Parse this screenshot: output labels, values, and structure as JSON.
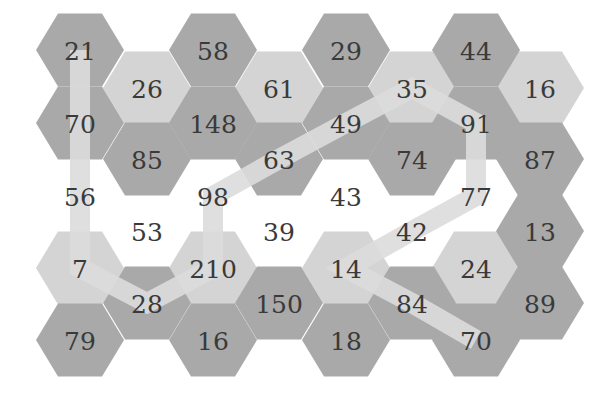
{
  "puzzle": {
    "type": "hexagonal number path puzzle",
    "colors": {
      "dark": "#a9a9a9",
      "light": "#d4d4d4",
      "white": "#ffffff",
      "path": "#dcdcdc",
      "text": "#3a3a3a"
    },
    "cells": [
      {
        "id": "c0r0",
        "col": 0,
        "row": 0,
        "value": "21",
        "shade": "dark"
      },
      {
        "id": "c0r1",
        "col": 0,
        "row": 1,
        "value": "70",
        "shade": "dark"
      },
      {
        "id": "c0r2",
        "col": 0,
        "row": 2,
        "value": "56",
        "shade": "white"
      },
      {
        "id": "c0r3",
        "col": 0,
        "row": 3,
        "value": "7",
        "shade": "light"
      },
      {
        "id": "c0r4",
        "col": 0,
        "row": 4,
        "value": "79",
        "shade": "dark"
      },
      {
        "id": "c1r0",
        "col": 1,
        "row": 0,
        "value": "26",
        "shade": "light"
      },
      {
        "id": "c1r1",
        "col": 1,
        "row": 1,
        "value": "85",
        "shade": "dark"
      },
      {
        "id": "c1r2",
        "col": 1,
        "row": 2,
        "value": "53",
        "shade": "white"
      },
      {
        "id": "c1r3",
        "col": 1,
        "row": 3,
        "value": "28",
        "shade": "dark"
      },
      {
        "id": "c2r0",
        "col": 2,
        "row": 0,
        "value": "58",
        "shade": "dark"
      },
      {
        "id": "c2r1",
        "col": 2,
        "row": 1,
        "value": "148",
        "shade": "dark"
      },
      {
        "id": "c2r2",
        "col": 2,
        "row": 2,
        "value": "98",
        "shade": "white"
      },
      {
        "id": "c2r3",
        "col": 2,
        "row": 3,
        "value": "210",
        "shade": "light"
      },
      {
        "id": "c2r4",
        "col": 2,
        "row": 4,
        "value": "16",
        "shade": "dark"
      },
      {
        "id": "c3r0",
        "col": 3,
        "row": 0,
        "value": "61",
        "shade": "light"
      },
      {
        "id": "c3r1",
        "col": 3,
        "row": 1,
        "value": "63",
        "shade": "dark"
      },
      {
        "id": "c3r2",
        "col": 3,
        "row": 2,
        "value": "39",
        "shade": "white"
      },
      {
        "id": "c3r3",
        "col": 3,
        "row": 3,
        "value": "150",
        "shade": "dark"
      },
      {
        "id": "c4r0",
        "col": 4,
        "row": 0,
        "value": "29",
        "shade": "dark"
      },
      {
        "id": "c4r1",
        "col": 4,
        "row": 1,
        "value": "49",
        "shade": "dark"
      },
      {
        "id": "c4r2",
        "col": 4,
        "row": 2,
        "value": "43",
        "shade": "white"
      },
      {
        "id": "c4r3",
        "col": 4,
        "row": 3,
        "value": "14",
        "shade": "light"
      },
      {
        "id": "c4r4",
        "col": 4,
        "row": 4,
        "value": "18",
        "shade": "dark"
      },
      {
        "id": "c5r0",
        "col": 5,
        "row": 0,
        "value": "35",
        "shade": "light"
      },
      {
        "id": "c5r1",
        "col": 5,
        "row": 1,
        "value": "74",
        "shade": "dark"
      },
      {
        "id": "c5r2",
        "col": 5,
        "row": 2,
        "value": "42",
        "shade": "white"
      },
      {
        "id": "c5r3",
        "col": 5,
        "row": 3,
        "value": "84",
        "shade": "dark"
      },
      {
        "id": "c6r0",
        "col": 6,
        "row": 0,
        "value": "44",
        "shade": "dark"
      },
      {
        "id": "c6r1",
        "col": 6,
        "row": 1,
        "value": "91",
        "shade": "dark"
      },
      {
        "id": "c6r2",
        "col": 6,
        "row": 2,
        "value": "77",
        "shade": "white"
      },
      {
        "id": "c6r3",
        "col": 6,
        "row": 3,
        "value": "24",
        "shade": "light"
      },
      {
        "id": "c6r4",
        "col": 6,
        "row": 4,
        "value": "70",
        "shade": "dark"
      },
      {
        "id": "c7r0",
        "col": 7,
        "row": 0,
        "value": "16",
        "shade": "light"
      },
      {
        "id": "c7r1",
        "col": 7,
        "row": 1,
        "value": "87",
        "shade": "dark"
      },
      {
        "id": "c7r2",
        "col": 7,
        "row": 2,
        "value": "13",
        "shade": "dark"
      },
      {
        "id": "c7r3",
        "col": 7,
        "row": 3,
        "value": "89",
        "shade": "dark"
      }
    ],
    "path": [
      "c0r0",
      "c0r1",
      "c0r2",
      "c0r3",
      "c1r3",
      "c2r3",
      "c2r2",
      "c3r1",
      "c4r1",
      "c5r0",
      "c6r1",
      "c6r2",
      "c5r2",
      "c4r3",
      "c5r3",
      "c6r4"
    ],
    "path_values": [
      "21",
      "70",
      "56",
      "7",
      "28",
      "210",
      "98",
      "63",
      "49",
      "35",
      "91",
      "77",
      "42",
      "14",
      "84",
      "70"
    ]
  }
}
